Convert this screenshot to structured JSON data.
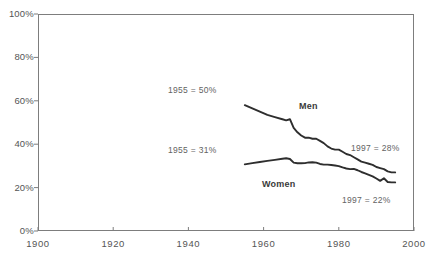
{
  "chart_data": {
    "type": "line",
    "title": "",
    "xlabel": "",
    "ylabel": "",
    "xlim": [
      1900,
      2000
    ],
    "ylim": [
      0,
      100
    ],
    "grid": false,
    "legend_position": "inline-labels",
    "x_ticks": [
      "1900",
      "1920",
      "1940",
      "1960",
      "1980",
      "2000"
    ],
    "x_tick_values": [
      1900,
      1920,
      1940,
      1960,
      1980,
      2000
    ],
    "y_ticks": [
      "0%",
      "20%",
      "40%",
      "60%",
      "80%",
      "100%"
    ],
    "y_tick_values": [
      0,
      20,
      40,
      60,
      80,
      100
    ],
    "series": [
      {
        "name": "Men",
        "x": [
          1955,
          1957,
          1959,
          1961,
          1963,
          1965,
          1966,
          1967,
          1968,
          1969,
          1970,
          1971,
          1972,
          1973,
          1974,
          1975,
          1976,
          1977,
          1978,
          1979,
          1980,
          1981,
          1982,
          1983,
          1984,
          1985,
          1986,
          1987,
          1988,
          1989,
          1990,
          1991,
          1992,
          1993,
          1994,
          1995
        ],
        "values": [
          58,
          56.5,
          55,
          53.5,
          52.5,
          51.5,
          51,
          51.5,
          47.5,
          45.5,
          44,
          43,
          43,
          42.5,
          42.5,
          41.5,
          40.5,
          39,
          38,
          37.5,
          37.5,
          36.5,
          35.5,
          35,
          34,
          33,
          32,
          31.5,
          31,
          30.5,
          29.5,
          29,
          28.5,
          27.5,
          27,
          27
        ]
      },
      {
        "name": "Women",
        "x": [
          1955,
          1957,
          1959,
          1961,
          1963,
          1965,
          1966,
          1967,
          1968,
          1969,
          1970,
          1971,
          1972,
          1973,
          1974,
          1975,
          1976,
          1977,
          1978,
          1979,
          1980,
          1981,
          1982,
          1983,
          1984,
          1985,
          1986,
          1987,
          1988,
          1989,
          1990,
          1991,
          1992,
          1993,
          1994,
          1995
        ],
        "values": [
          30.7,
          31.3,
          31.8,
          32.3,
          32.8,
          33.3,
          33.5,
          33.2,
          31.5,
          31.2,
          31.2,
          31.3,
          31.6,
          31.7,
          31.5,
          30.9,
          30.6,
          30.6,
          30.4,
          30.2,
          29.9,
          29.3,
          28.8,
          28.5,
          28.6,
          28,
          27.2,
          26.6,
          25.9,
          25.2,
          24.2,
          23.1,
          24.3,
          22.6,
          22.4,
          22.4
        ]
      }
    ],
    "annotations": [
      {
        "id": "men-start",
        "text": "1955 = 50%",
        "x_px": 168,
        "y_px": 85
      },
      {
        "id": "women-start",
        "text": "1955 = 31%",
        "x_px": 168,
        "y_px": 145
      },
      {
        "id": "men-end",
        "text": "1997 = 28%",
        "x_px": 351,
        "y_px": 143
      },
      {
        "id": "women-end",
        "text": "1997 = 22%",
        "x_px": 342,
        "y_px": 195
      }
    ],
    "series_labels": [
      {
        "id": "men-label",
        "text": "Men",
        "x_px": 299,
        "y_px": 101
      },
      {
        "id": "women-label",
        "text": "Women",
        "x_px": 262,
        "y_px": 179
      }
    ],
    "colors": {
      "line": "#2e2e2e",
      "axis": "#7d7d7d",
      "tick_text": "#555555",
      "annotation_text": "#636363",
      "series_label_text": "#3a3a3a",
      "background": "#ffffff"
    },
    "geometry": {
      "plot_left_px": 38,
      "plot_right_px": 414,
      "plot_top_px": 14,
      "plot_bottom_px": 231
    }
  }
}
